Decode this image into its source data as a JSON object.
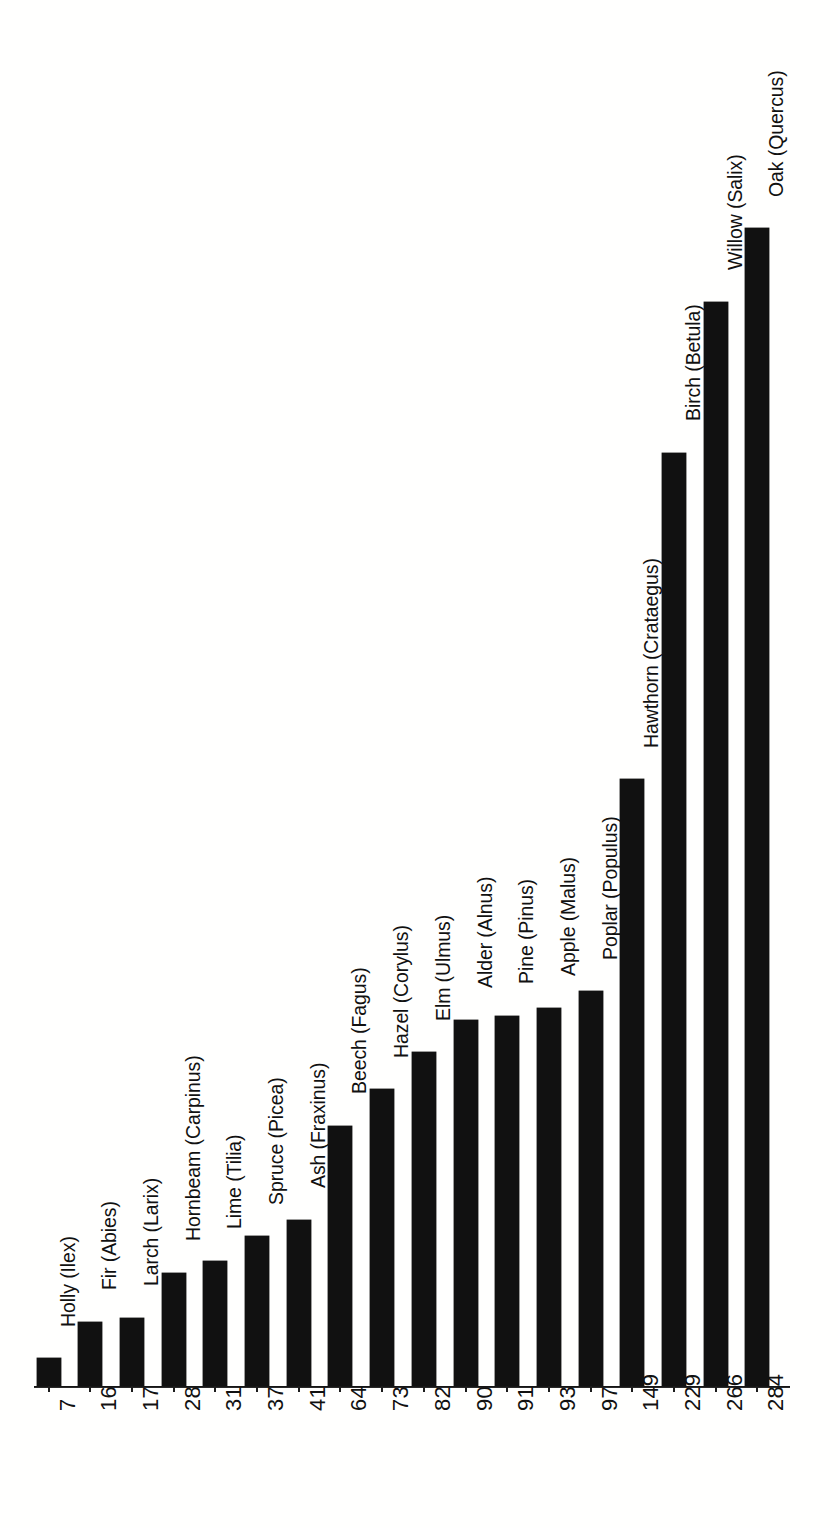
{
  "chart_data": {
    "type": "bar",
    "orientation": "vertical",
    "title": "",
    "subtitle": "",
    "xlabel": "",
    "ylabel": "",
    "ylim": [
      0,
      290
    ],
    "grid": false,
    "legend": null,
    "axis_color": "#111111",
    "bar_color": "#111111",
    "background_color": "#ffffff",
    "value_labels_shown": true,
    "category_labels_rotated_deg": 90,
    "value_labels_rotated_deg": 90,
    "categories": [
      "Holly (Ilex)",
      "Fir (Abies)",
      "Larch (Larix)",
      "Hornbeam (Carpinus)",
      "Lime (Tilia)",
      "Spruce (Picea)",
      "Ash (Fraxinus)",
      "Beech (Fagus)",
      "Hazel (Corylus)",
      "Elm (Ulmus)",
      "Alder (Alnus)",
      "Pine (Pinus)",
      "Apple (Malus)",
      "Poplar (Populus)",
      "Hawthorn (Crataegus)",
      "Birch (Betula)",
      "Willow (Salix)",
      "Oak (Quercus)"
    ],
    "values": [
      7,
      16,
      17,
      28,
      31,
      37,
      41,
      64,
      73,
      82,
      90,
      91,
      93,
      97,
      149,
      229,
      266,
      284
    ],
    "value_tick_labels": [
      "7",
      "16",
      "17",
      "28",
      "31",
      "37",
      "41",
      "64",
      "73",
      "82",
      "90",
      "91",
      "93",
      "97",
      "149",
      "229",
      "266",
      "284"
    ]
  }
}
